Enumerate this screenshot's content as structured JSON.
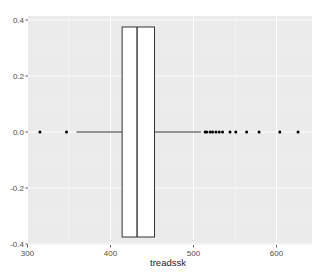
{
  "chart_data": {
    "type": "boxplot",
    "orientation": "horizontal",
    "title": "",
    "xlabel": "treadssk",
    "ylabel": "",
    "xlim": [
      300,
      640
    ],
    "ylim": [
      -0.4,
      0.4
    ],
    "x_ticks": [
      300,
      400,
      500,
      600
    ],
    "x_tick_labels": [
      "300",
      "400",
      "500",
      "600"
    ],
    "y_ticks": [
      -0.4,
      -0.2,
      0.0,
      0.2,
      0.4
    ],
    "y_tick_labels": [
      "-0.4",
      "-0.2",
      "0.0",
      "0.2",
      "0.4"
    ],
    "grid": true,
    "legend": null,
    "box": {
      "whisker_low": 359,
      "q1": 414,
      "median": 432,
      "q3": 453,
      "whisker_high": 509,
      "y_center": 0.0,
      "box_height": [
        -0.375,
        0.375
      ]
    },
    "outliers": [
      315,
      347,
      514,
      516,
      520,
      523,
      527,
      531,
      535,
      544,
      551,
      564,
      579,
      604,
      626
    ],
    "colors": {
      "panel_bg": "#ebebeb",
      "grid_major": "#ffffff",
      "box_fill": "#ffffff",
      "box_stroke": "#333333",
      "points": "#000000"
    }
  }
}
